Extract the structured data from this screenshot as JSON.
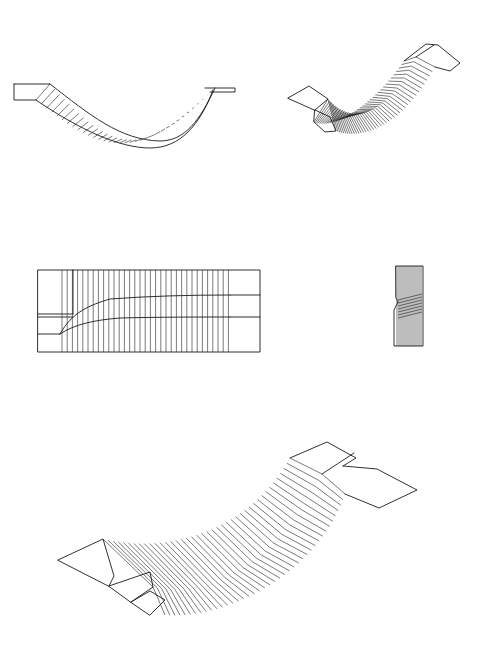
{
  "figure": {
    "views": [
      {
        "id": "side-elevation",
        "label": ""
      },
      {
        "id": "iso-small",
        "label": ""
      },
      {
        "id": "plan-view",
        "label": ""
      },
      {
        "id": "end-view",
        "label": ""
      },
      {
        "id": "iso-large",
        "label": ""
      }
    ],
    "colors": {
      "line": "#1a1a1a",
      "background": "#ffffff"
    }
  }
}
